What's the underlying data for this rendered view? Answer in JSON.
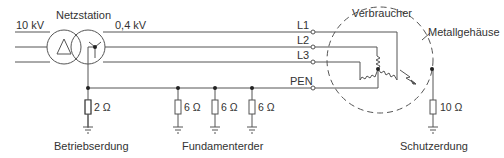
{
  "diagram": {
    "type": "TN-C power system grounding diagram",
    "labels": {
      "primary_voltage": "10 kV",
      "station": "Netzstation",
      "secondary_voltage": "0,4 kV",
      "consumer": "Verbraucher",
      "housing": "Metallgehäuse",
      "operating_earth": "Betriebserdung",
      "foundation_earth": "Fundamenterder",
      "protective_earth": "Schutzerdung"
    },
    "conductors": [
      "L1",
      "L2",
      "L3",
      "PEN"
    ],
    "resistors": {
      "operating": "2 Ω",
      "foundation": [
        "6 Ω",
        "6 Ω",
        "6 Ω"
      ],
      "protective": "10 Ω"
    },
    "colors": {
      "line": "#555555",
      "text": "#333333",
      "background": "#ffffff"
    }
  }
}
